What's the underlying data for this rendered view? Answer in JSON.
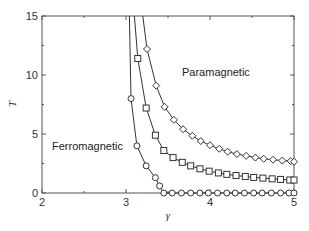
{
  "chart_data": {
    "type": "line",
    "title": "",
    "xlabel": "γ",
    "ylabel": "T",
    "xlim": [
      2,
      5
    ],
    "ylim": [
      0,
      15
    ],
    "xticks": [
      2,
      3,
      4,
      5
    ],
    "yticks": [
      0,
      5,
      10,
      15
    ],
    "grid": false,
    "legend": null,
    "annotations": [
      {
        "text": "Ferromagnetic",
        "x": 2.1,
        "y": 5.5
      },
      {
        "text": "Paramagnetic",
        "x": 3.65,
        "y": 10.5
      }
    ],
    "series": [
      {
        "name": "circles",
        "marker": "circle",
        "x": [
          3.04,
          3.06,
          3.13,
          3.24,
          3.35,
          3.4,
          3.45,
          3.55,
          3.66,
          3.77,
          3.88,
          3.98,
          4.09,
          4.2,
          4.3,
          4.41,
          4.52,
          4.62,
          4.73,
          4.84,
          4.94,
          5.0
        ],
        "y": [
          15.0,
          8.0,
          4.0,
          2.3,
          1.3,
          0.6,
          0.0,
          0.0,
          0.0,
          0.0,
          0.0,
          0.0,
          0.0,
          0.0,
          0.0,
          0.0,
          0.0,
          0.0,
          0.0,
          0.0,
          0.0,
          0.0
        ],
        "marker_x": [
          3.06,
          3.13,
          3.24,
          3.35,
          3.4,
          3.45,
          3.55,
          3.66,
          3.77,
          3.88,
          3.98,
          4.09,
          4.2,
          4.3,
          4.41,
          4.52,
          4.62,
          4.73,
          4.84,
          4.94,
          5.0
        ]
      },
      {
        "name": "squares",
        "marker": "square",
        "x": [
          3.1,
          3.14,
          3.24,
          3.35,
          3.45,
          3.56,
          3.67,
          3.77,
          3.88,
          3.99,
          4.1,
          4.2,
          4.31,
          4.42,
          4.52,
          4.63,
          4.74,
          4.84,
          4.95,
          5.0
        ],
        "y": [
          15.0,
          11.4,
          7.2,
          4.9,
          3.6,
          3.0,
          2.6,
          2.3,
          2.05,
          1.85,
          1.7,
          1.58,
          1.48,
          1.4,
          1.32,
          1.26,
          1.2,
          1.15,
          1.1,
          1.1
        ]
      },
      {
        "name": "diamonds",
        "marker": "diamond",
        "x": [
          3.2,
          3.25,
          3.36,
          3.46,
          3.57,
          3.68,
          3.79,
          3.89,
          4.0,
          4.11,
          4.21,
          4.32,
          4.43,
          4.54,
          4.64,
          4.75,
          4.86,
          4.96,
          5.0
        ],
        "y": [
          15.0,
          12.2,
          9.1,
          7.3,
          6.2,
          5.4,
          4.85,
          4.4,
          4.05,
          3.75,
          3.5,
          3.3,
          3.15,
          3.0,
          2.9,
          2.82,
          2.75,
          2.7,
          2.65
        ]
      }
    ]
  },
  "plot": {
    "x_title": "γ",
    "y_title": "T",
    "x_tick_labels": [
      "2",
      "3",
      "4",
      "5"
    ],
    "y_tick_labels": [
      "0",
      "5",
      "10",
      "15"
    ],
    "ferro_label": "Ferromagnetic",
    "para_label": "Paramagnetic",
    "line_color": "#333333",
    "axis_color": "#555555"
  }
}
